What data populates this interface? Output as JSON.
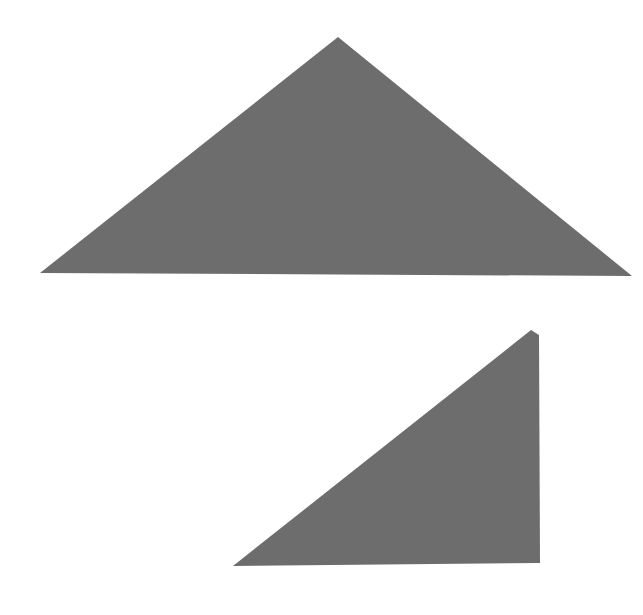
{
  "canvas": {
    "width": 643,
    "height": 615,
    "background": "#ffffff"
  },
  "shapes": [
    {
      "name": "large-triangle",
      "type": "triangle",
      "fill": "#6d6d6d",
      "points": "338,37 632,276 40,273"
    },
    {
      "name": "small-right-triangle",
      "type": "triangle",
      "fill": "#6d6d6d",
      "points": "531,330 539,335 540,563 233,566"
    }
  ]
}
